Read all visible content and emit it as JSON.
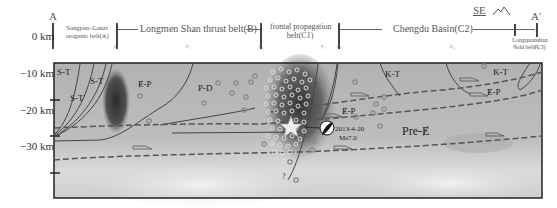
{
  "header": {
    "endpoint_left": "A",
    "endpoint_right": "A′",
    "direction": "SE",
    "zones": [
      {
        "id": "A",
        "label_line1": "Songpan–Ganzi",
        "label_line2": "orogenic belt(A)"
      },
      {
        "id": "B",
        "label": "Longmen Shan thrust belt(B)"
      },
      {
        "id": "C1",
        "label_line1": "frontal propagation",
        "label_line2": "belt(C1)"
      },
      {
        "id": "C2",
        "label": "Chengdu Basin(C2)"
      },
      {
        "id": "C3",
        "label_line1": "Longquanshan",
        "label_line2": "fold belt(C3)"
      }
    ],
    "fault_ticks": [
      "F₁",
      "F₂",
      "F₃",
      "F₄",
      "F₅",
      "F₆",
      "F₇",
      "F₈"
    ]
  },
  "depth_axis": {
    "labels": [
      "0 km",
      "−10 km",
      "−20 km",
      "−30 km"
    ]
  },
  "section": {
    "units": [
      {
        "id": "st1",
        "label": "S-T"
      },
      {
        "id": "st2",
        "label": "S-T"
      },
      {
        "id": "st3",
        "label": "S-T"
      },
      {
        "id": "ep1",
        "label": "Ɇ-P"
      },
      {
        "id": "pd",
        "label": "P-D"
      },
      {
        "id": "kt1",
        "label": "K-T"
      },
      {
        "id": "kt2",
        "label": "K-T"
      },
      {
        "id": "ep2",
        "label": "Ɇ-P"
      },
      {
        "id": "ep3",
        "label": "Ɇ-P"
      },
      {
        "id": "pre",
        "label": "Pre-Ɇ"
      }
    ],
    "event": {
      "date": "2013-4-20",
      "magnitude": "Ms7.0"
    },
    "question_mark": "?"
  }
}
